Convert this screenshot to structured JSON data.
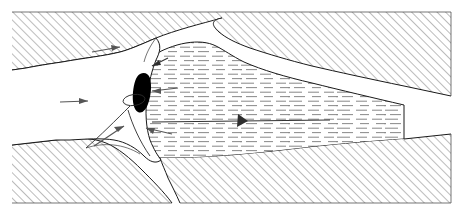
{
  "figure": {
    "title": "Geologic cross-section: slump block and liquefied layer",
    "background_color": "#ffffff",
    "width": 463,
    "height": 215,
    "style": "line drawing, black and white, hatched and dashed fill patterns"
  },
  "palette": {
    "outline": "#1a1a1a",
    "hatch_line": "#8a8a8a",
    "dash_fill_line": "#8c8c8c",
    "arrow": "#555555",
    "solid_wedge": "#000000",
    "paper": "#ffffff"
  },
  "regions": [
    {
      "id": "bedrock-upper-left",
      "label": "upper left hatched bedrock",
      "fill_pattern": "diagonal-hatch",
      "hatch_angle_deg": 45,
      "interactable": false
    },
    {
      "id": "bedrock-upper-right",
      "label": "upper right hatched bedrock",
      "fill_pattern": "diagonal-hatch",
      "hatch_angle_deg": 45,
      "interactable": false
    },
    {
      "id": "bedrock-lower-left",
      "label": "lower left hatched bedrock",
      "fill_pattern": "diagonal-hatch",
      "hatch_angle_deg": 45,
      "interactable": false
    },
    {
      "id": "bedrock-lower-right",
      "label": "lower right hatched bedrock",
      "fill_pattern": "diagonal-hatch",
      "hatch_angle_deg": 45,
      "interactable": false
    },
    {
      "id": "liquefied-layer",
      "label": "central tapering layer with horizontal dash fill",
      "fill_pattern": "horizontal-dashes",
      "interactable": false
    },
    {
      "id": "slide-mass",
      "label": "white displaced slide mass",
      "fill_pattern": "none",
      "interactable": false
    },
    {
      "id": "solid-wedge",
      "label": "solid black wedge at head scarp",
      "fill_pattern": "solid",
      "interactable": false
    }
  ],
  "annotations": {
    "arrows": [
      {
        "id": "arrow-upper-left",
        "direction": "right",
        "description": "horizontal flow arrow in upper white mass"
      },
      {
        "id": "arrow-lower-left",
        "direction": "right",
        "description": "horizontal flow arrow in lower white mass"
      },
      {
        "id": "arrow-slip-surface",
        "direction": "up-right",
        "description": "arrow along basal slip surface"
      },
      {
        "id": "arrow-head-scarp",
        "direction": "left",
        "description": "short arrow at head of layer"
      },
      {
        "id": "arrow-layer-upper",
        "direction": "left",
        "description": "arrow pointing left into layer, upper"
      },
      {
        "id": "arrow-layer-lower",
        "direction": "left",
        "description": "arrow pointing left into layer, lower"
      },
      {
        "id": "arrow-layer-axis",
        "direction": "left",
        "description": "long axial arrow along layer centre line"
      }
    ],
    "markers": [
      {
        "id": "ellipse-marker",
        "description": "small ellipse outline at head scarp"
      }
    ]
  }
}
